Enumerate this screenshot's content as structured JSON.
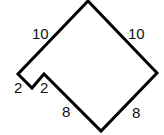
{
  "diagram": {
    "type": "polygon-with-side-lengths",
    "stroke_color": "#000000",
    "vertices": [
      [
        88,
        1
      ],
      [
        157,
        73
      ],
      [
        101,
        131
      ],
      [
        44,
        74
      ],
      [
        32,
        88
      ],
      [
        18,
        74
      ]
    ],
    "labels": [
      {
        "id": "top-left",
        "text": "10",
        "x": 32,
        "y": 26
      },
      {
        "id": "top-right",
        "text": "10",
        "x": 128,
        "y": 26
      },
      {
        "id": "notch-left",
        "text": "2",
        "x": 14,
        "y": 84
      },
      {
        "id": "notch-right",
        "text": "2",
        "x": 40,
        "y": 84
      },
      {
        "id": "bottom-left",
        "text": "8",
        "x": 62,
        "y": 104
      },
      {
        "id": "bottom-right",
        "text": "8",
        "x": 132,
        "y": 105
      }
    ]
  }
}
